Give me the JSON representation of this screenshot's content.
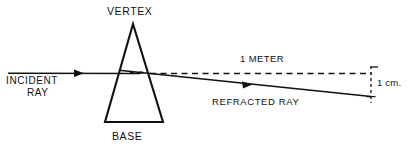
{
  "figure": {
    "background_color": "#ffffff",
    "ink_color": "#111111"
  },
  "labels": {
    "vertex": "VERTEX",
    "base": "BASE",
    "incident_ray_line1": "INCIDENT",
    "incident_ray_line2": "RAY",
    "distance": "1 METER",
    "refracted_ray": "REFRACTED RAY",
    "deviation": "1 cm."
  },
  "geometry": {
    "prism": {
      "apex": {
        "x": 133,
        "y": 24
      },
      "base_left": {
        "x": 105,
        "y": 122
      },
      "base_right": {
        "x": 163,
        "y": 122
      }
    },
    "incident_ray": {
      "start": {
        "x": 8,
        "y": 73
      },
      "end": {
        "x": 133,
        "y": 73
      },
      "arrow_at": {
        "x": 83,
        "y": 73
      }
    },
    "undeviated_dashed_path": {
      "start": {
        "x": 152,
        "y": 73
      },
      "end": {
        "x": 371,
        "y": 73
      }
    },
    "refracted_ray": {
      "start": {
        "x": 120,
        "y": 70
      },
      "end": {
        "x": 371,
        "y": 96
      },
      "arrow_at": {
        "x": 252,
        "y": 84
      }
    },
    "deviation_marker": {
      "x": 371,
      "top_y": 68,
      "bottom_y": 101
    }
  },
  "icons": {
    "arrowhead": "arrowhead-icon"
  }
}
